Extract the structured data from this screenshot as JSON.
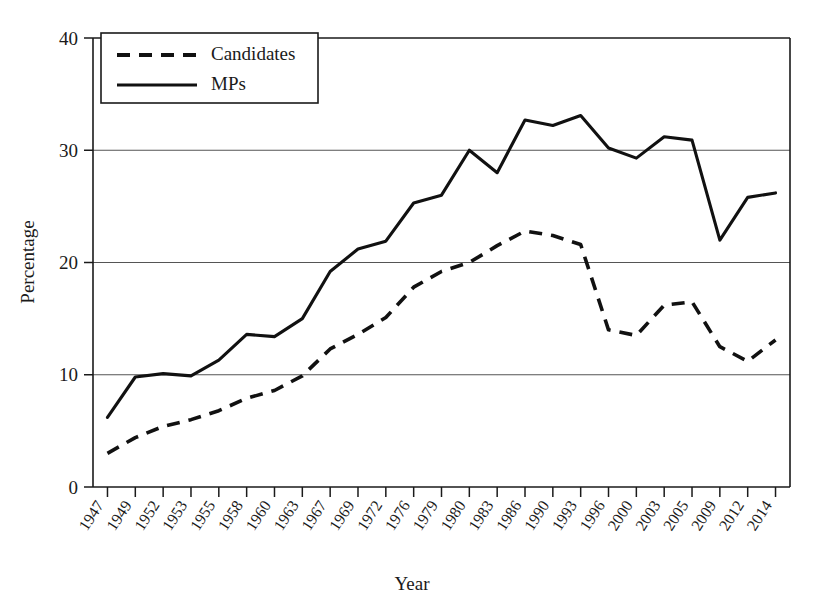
{
  "chart_data": {
    "type": "line",
    "title": "",
    "xlabel": "Year",
    "ylabel": "Percentage",
    "ylim": [
      0,
      40
    ],
    "yticks": [
      0,
      10,
      20,
      30,
      40
    ],
    "grid": "horizontal",
    "legend_position": "top-left",
    "categories": [
      "1947",
      "1949",
      "1952",
      "1953",
      "1955",
      "1958",
      "1960",
      "1963",
      "1967",
      "1969",
      "1972",
      "1976",
      "1979",
      "1980",
      "1983",
      "1986",
      "1990",
      "1993",
      "1996",
      "2000",
      "2003",
      "2005",
      "2009",
      "2012",
      "2014"
    ],
    "series": [
      {
        "name": "Candidates",
        "style": "dashed",
        "values": [
          3.0,
          4.4,
          5.4,
          6.0,
          6.8,
          7.9,
          8.6,
          9.9,
          12.3,
          13.6,
          15.1,
          17.8,
          19.2,
          20.0,
          21.5,
          22.8,
          22.4,
          21.6,
          14.0,
          13.5,
          16.2,
          16.5,
          12.5,
          11.2,
          13.1
        ]
      },
      {
        "name": "MPs",
        "style": "solid",
        "values": [
          6.2,
          9.8,
          10.1,
          9.9,
          11.3,
          13.6,
          13.4,
          15.0,
          19.2,
          21.2,
          21.9,
          25.3,
          26.0,
          30.0,
          28.0,
          32.7,
          32.2,
          33.1,
          30.2,
          29.3,
          31.2,
          30.9,
          22.0,
          25.8,
          26.2
        ]
      }
    ],
    "legend": [
      {
        "label": "Candidates",
        "style": "dashed"
      },
      {
        "label": "MPs",
        "style": "solid"
      }
    ],
    "colors": {
      "line": "#111111",
      "grid": "#555555",
      "axis": "#1a1a1a",
      "background": "#ffffff"
    }
  }
}
